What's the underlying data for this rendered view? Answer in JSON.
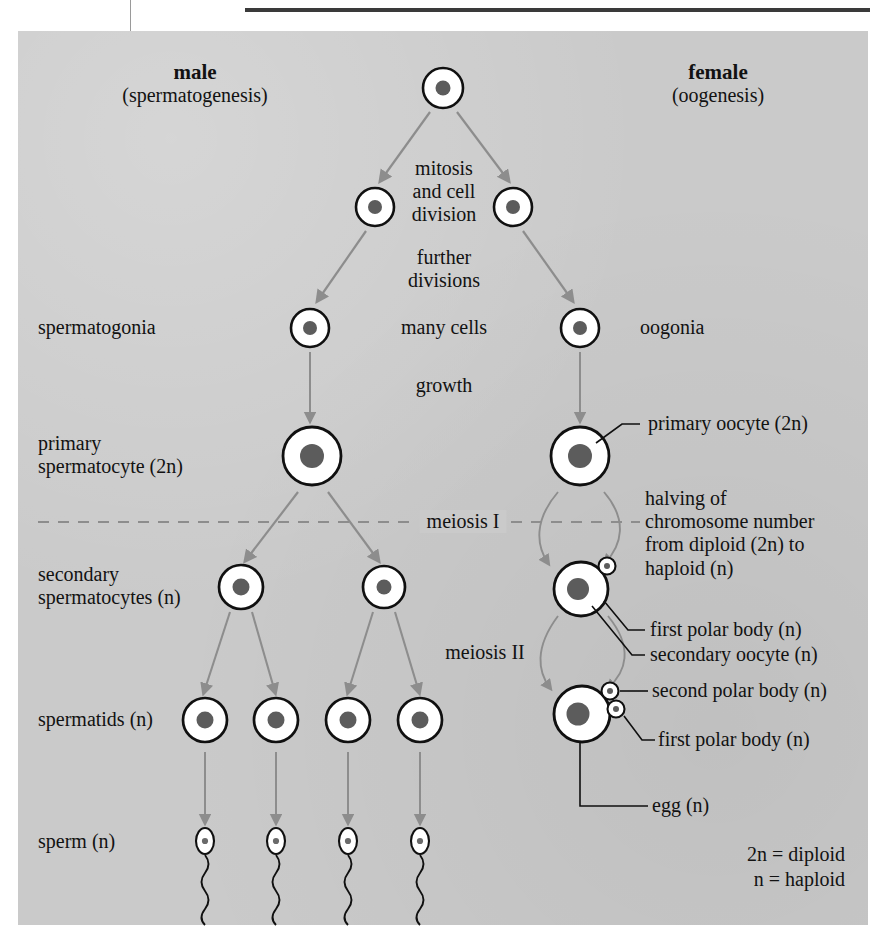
{
  "figure": {
    "title_left": "male",
    "subtitle_left": "(spermatogenesis)",
    "title_right": "female",
    "subtitle_right": "(oogenesis)",
    "background_color": "#cacaca",
    "arrow_color": "#8d8d8d",
    "ink_color": "#101010"
  },
  "center_labels": {
    "mitosis": "mitosis\nand cell\ndivision",
    "further_divisions": "further\ndivisions",
    "many_cells": "many cells",
    "growth": "growth",
    "meiosis_1": "meiosis I",
    "meiosis_2": "meiosis II"
  },
  "male_labels": {
    "spermatogonia": "spermatogonia",
    "primary_spermatocyte": "primary\nspermatocyte (2n)",
    "secondary_spermatocytes": "secondary\nspermatocytes (n)",
    "spermatids": "spermatids (n)",
    "sperm": "sperm (n)"
  },
  "female_labels": {
    "oogonia": "oogonia",
    "primary_oocyte": "primary oocyte (2n)",
    "halving_note": "halving of\nchromosome number\nfrom diploid (2n) to\nhaploid (n)",
    "first_polar_body_a": "first polar body (n)",
    "secondary_oocyte": "secondary oocyte (n)",
    "second_polar_body": "second polar body (n)",
    "first_polar_body_b": "first polar body (n)",
    "egg": "egg (n)"
  },
  "key": {
    "diploid": "2n = diploid",
    "haploid": "n = haploid"
  }
}
